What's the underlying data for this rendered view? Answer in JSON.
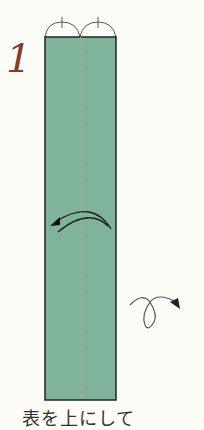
{
  "step": {
    "number": "1",
    "caption": "表を上にして"
  },
  "paper": {
    "color": "#7fb39a",
    "border_color": "#222222",
    "fold_line_color": "#c8a070"
  },
  "symbols": {
    "valley_fold_arrow": "valley-fold-arrow",
    "turn_over": "turn-over-loop-arrow",
    "equal_division": "equal-division-arcs"
  }
}
